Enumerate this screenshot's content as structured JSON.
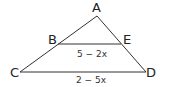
{
  "diagram": {
    "type": "geometry-triangle",
    "points": {
      "A": {
        "label": "A",
        "x": 97,
        "y": 16
      },
      "B": {
        "label": "B",
        "x": 58,
        "y": 44
      },
      "E": {
        "label": "E",
        "x": 121,
        "y": 44
      },
      "C": {
        "label": "C",
        "x": 20,
        "y": 72
      },
      "D": {
        "label": "D",
        "x": 146,
        "y": 72
      }
    },
    "segments": {
      "BE": {
        "expression": "5 − 2x"
      },
      "CD": {
        "expression": "2 − 5x"
      }
    },
    "colors": {
      "line": "#333333",
      "text": "#222222",
      "background": "#ffffff"
    }
  }
}
